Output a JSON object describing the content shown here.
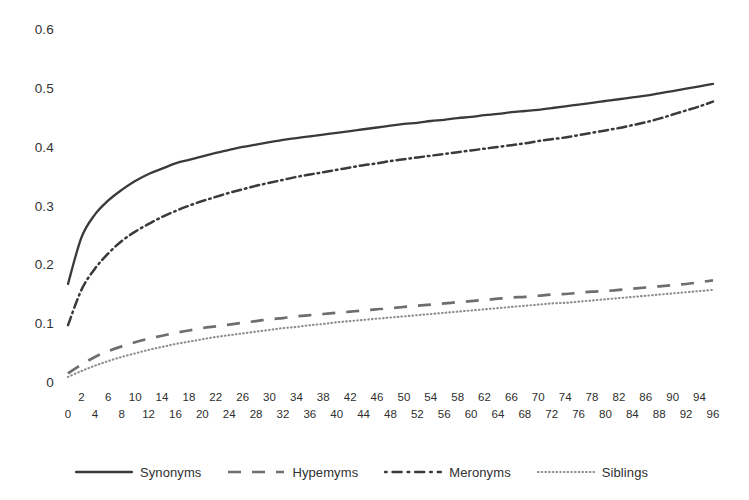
{
  "chart_data": {
    "type": "line",
    "title": "",
    "xlabel": "",
    "ylabel": "",
    "xlim": [
      0,
      96
    ],
    "ylim": [
      0,
      0.6
    ],
    "grid": false,
    "legend_position": "bottom",
    "y_ticks": [
      "0.6",
      "0.5",
      "0.4",
      "0.3",
      "0.2",
      "0.1",
      "0"
    ],
    "y_tick_values": [
      0.6,
      0.5,
      0.4,
      0.3,
      0.2,
      0.1,
      0
    ],
    "x_ticks_upper": [
      "2",
      "6",
      "10",
      "14",
      "18",
      "22",
      "26",
      "30",
      "34",
      "38",
      "42",
      "46",
      "50",
      "54",
      "58",
      "62",
      "66",
      "70",
      "74",
      "78",
      "82",
      "86",
      "90",
      "94"
    ],
    "x_ticks_lower": [
      "0",
      "4",
      "8",
      "12",
      "16",
      "20",
      "24",
      "28",
      "32",
      "36",
      "40",
      "44",
      "48",
      "52",
      "56",
      "60",
      "64",
      "68",
      "72",
      "76",
      "80",
      "84",
      "88",
      "92",
      "96"
    ],
    "x": [
      0,
      2,
      4,
      6,
      8,
      10,
      12,
      14,
      16,
      18,
      20,
      22,
      24,
      26,
      28,
      30,
      32,
      34,
      36,
      38,
      40,
      42,
      44,
      46,
      48,
      50,
      52,
      54,
      56,
      58,
      60,
      62,
      64,
      66,
      68,
      70,
      72,
      74,
      76,
      78,
      80,
      82,
      84,
      86,
      88,
      90,
      92,
      94,
      96
    ],
    "series": [
      {
        "name": "Synonyms",
        "style": "solid",
        "color": "#3a3a3a",
        "values": [
          0.17,
          0.249,
          0.288,
          0.312,
          0.33,
          0.345,
          0.357,
          0.366,
          0.375,
          0.381,
          0.387,
          0.393,
          0.398,
          0.403,
          0.407,
          0.411,
          0.415,
          0.418,
          0.421,
          0.424,
          0.427,
          0.43,
          0.433,
          0.436,
          0.439,
          0.442,
          0.444,
          0.447,
          0.449,
          0.452,
          0.454,
          0.457,
          0.459,
          0.462,
          0.464,
          0.466,
          0.469,
          0.472,
          0.475,
          0.478,
          0.481,
          0.484,
          0.487,
          0.49,
          0.494,
          0.498,
          0.502,
          0.506,
          0.51
        ]
      },
      {
        "name": "Hypemyms",
        "style": "dashed",
        "color": "#6b6b6b",
        "values": [
          0.018,
          0.033,
          0.046,
          0.056,
          0.064,
          0.071,
          0.077,
          0.082,
          0.087,
          0.091,
          0.095,
          0.098,
          0.101,
          0.104,
          0.107,
          0.11,
          0.112,
          0.115,
          0.117,
          0.119,
          0.121,
          0.123,
          0.125,
          0.127,
          0.129,
          0.131,
          0.133,
          0.135,
          0.137,
          0.139,
          0.141,
          0.143,
          0.145,
          0.147,
          0.148,
          0.15,
          0.152,
          0.153,
          0.155,
          0.157,
          0.158,
          0.16,
          0.162,
          0.164,
          0.166,
          0.168,
          0.17,
          0.173,
          0.176
        ]
      },
      {
        "name": "Meronyms",
        "style": "dash-dot",
        "color": "#3a3a3a",
        "values": [
          0.1,
          0.16,
          0.196,
          0.222,
          0.243,
          0.259,
          0.272,
          0.284,
          0.294,
          0.303,
          0.311,
          0.318,
          0.325,
          0.331,
          0.337,
          0.342,
          0.347,
          0.352,
          0.356,
          0.36,
          0.364,
          0.368,
          0.372,
          0.375,
          0.379,
          0.382,
          0.385,
          0.388,
          0.391,
          0.394,
          0.397,
          0.4,
          0.403,
          0.406,
          0.409,
          0.413,
          0.416,
          0.419,
          0.423,
          0.427,
          0.431,
          0.435,
          0.44,
          0.445,
          0.451,
          0.458,
          0.465,
          0.472,
          0.48
        ]
      },
      {
        "name": "Siblings",
        "style": "dotted",
        "color": "#8a8a8a",
        "values": [
          0.012,
          0.022,
          0.031,
          0.039,
          0.046,
          0.052,
          0.058,
          0.063,
          0.068,
          0.072,
          0.076,
          0.08,
          0.083,
          0.086,
          0.089,
          0.092,
          0.095,
          0.097,
          0.1,
          0.102,
          0.105,
          0.107,
          0.109,
          0.111,
          0.113,
          0.115,
          0.117,
          0.119,
          0.121,
          0.123,
          0.125,
          0.127,
          0.129,
          0.131,
          0.133,
          0.135,
          0.137,
          0.138,
          0.14,
          0.142,
          0.144,
          0.146,
          0.148,
          0.15,
          0.152,
          0.154,
          0.156,
          0.158,
          0.16
        ]
      }
    ]
  },
  "legend": {
    "items": [
      {
        "label": "Synonyms"
      },
      {
        "label": "Hypemyms"
      },
      {
        "label": "Meronyms"
      },
      {
        "label": "Siblings"
      }
    ]
  }
}
